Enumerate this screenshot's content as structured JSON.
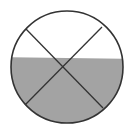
{
  "diagram": {
    "type": "fraction-circle",
    "circle": {
      "cx": 67,
      "cy": 67,
      "r": 56
    },
    "shaded_region": {
      "left_y": 57,
      "right_y": 59,
      "position": "bottom"
    },
    "lines": [
      {
        "x1": 26,
        "y1": 29,
        "x2": 103,
        "y2": 108
      },
      {
        "x1": 102,
        "y1": 27,
        "x2": 25,
        "y2": 105
      }
    ],
    "colors": {
      "background": "#ffffff",
      "fill": "#a3a3a3",
      "stroke": "#333333"
    }
  }
}
